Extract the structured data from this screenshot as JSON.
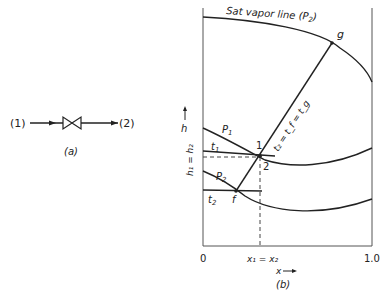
{
  "figure_a": {
    "inlet_label": "(1)",
    "outlet_label": "(2)",
    "caption": "(a)"
  },
  "figure_b": {
    "caption": "(b)",
    "sat_vapor_label": "Sat vapor line (P",
    "sat_vapor_sub": "2",
    "sat_vapor_close": ")",
    "point_g": "g",
    "point_1": "1",
    "point_2": "2",
    "point_f": "f",
    "isobar_p1": "P",
    "isobar_p1_sub": "1",
    "isobar_p2": "P",
    "isobar_p2_sub": "2",
    "isotherm_t1": "t",
    "isotherm_t1_sub": "1",
    "isotherm_t2": "t",
    "isotherm_t2_sub": "2",
    "tie_line_label": "t₂ = t_f = t_g",
    "y_axis_label": "h",
    "enthalpy_eq": "h₁ = h₂",
    "x_axis_label": "x",
    "x_tick_0": "0",
    "x_tick_1": "1.0",
    "quality_eq": "x₁ = x₂"
  },
  "colors": {
    "line": "#222222",
    "axis": "#555555"
  }
}
